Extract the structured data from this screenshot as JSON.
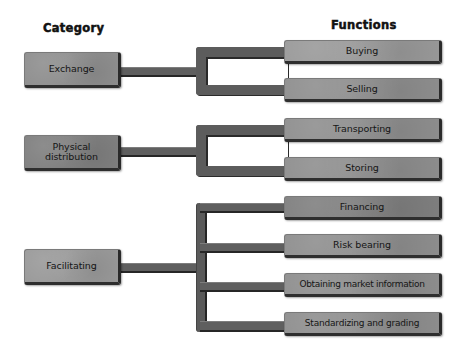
{
  "headers": {
    "category": "Category",
    "functions": "Functions"
  },
  "categories": [
    {
      "label": "Exchange",
      "functions": [
        "Buying",
        "Selling"
      ]
    },
    {
      "label_lines": [
        "Physical",
        "distribution"
      ],
      "label": "Physical distribution",
      "functions": [
        "Transporting",
        "Storing"
      ]
    },
    {
      "label": "Facilitating",
      "functions": [
        "Financing",
        "Risk bearing",
        "Obtaining market information",
        "Standardizing and grading"
      ]
    }
  ],
  "colors": {
    "box_fill": "#8f8f8f",
    "connector": "#5c5c5c",
    "edge_shadow": "#2a2a2a",
    "text": "#151515",
    "background": "#ffffff"
  }
}
